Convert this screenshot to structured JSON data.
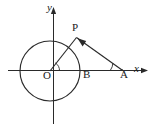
{
  "figure": {
    "background_color": "#ffffff",
    "stroke_color": "#1a1a1a",
    "width": 155,
    "height": 128
  },
  "axes": {
    "x_axis_label": "x",
    "y_axis_label": "y",
    "origin_label": "O",
    "x_axis_y": 70,
    "y_axis_x": 53,
    "x_axis_start": 8,
    "x_axis_end": 148,
    "y_axis_top": 8,
    "y_axis_bottom": 124,
    "has_x_arrow": true,
    "has_y_arrow": true
  },
  "circle": {
    "center_label": "O",
    "center_x": 50,
    "center_y": 71,
    "radius": 30
  },
  "points": [
    {
      "label": "P",
      "x": 76,
      "y": 37,
      "note": "point of tangency on circle"
    },
    {
      "label": "B",
      "x": 80,
      "y": 70,
      "note": "circle intersection with positive x-axis"
    },
    {
      "label": "A",
      "x": 122,
      "y": 70,
      "note": "external point on positive x-axis"
    },
    {
      "label": "O",
      "x": 50,
      "y": 71,
      "note": "origin and circle center"
    }
  ],
  "segments": [
    {
      "name": "OP",
      "from": "O",
      "to": "P"
    },
    {
      "name": "PA",
      "from": "P",
      "to": "A",
      "has_arrow_toward": "P"
    }
  ],
  "angles": [
    {
      "name": "angle-at-O",
      "vertex": "O",
      "between": "x-axis and OP",
      "arc_radius": 9
    },
    {
      "name": "angle-at-A",
      "vertex": "A",
      "between": "x-axis and AP",
      "arc_radius": 12
    }
  ]
}
